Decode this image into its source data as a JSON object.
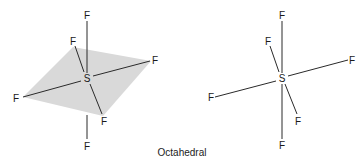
{
  "caption": "Octahedral",
  "molecules": [
    {
      "name": "octahedral-with-plane",
      "central_atom": "S",
      "ligands": [
        "F",
        "F",
        "F",
        "F",
        "F",
        "F"
      ],
      "equatorial_plane_shaded": true
    },
    {
      "name": "octahedral-skeletal",
      "central_atom": "S",
      "ligands": [
        "F",
        "F",
        "F",
        "F",
        "F",
        "F"
      ],
      "equatorial_plane_shaded": false
    }
  ],
  "colors": {
    "plane": "#d9d9d9",
    "bond": "#2a2a2a",
    "text": "#1a1a1a"
  }
}
